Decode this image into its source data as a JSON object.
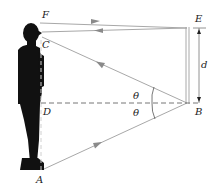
{
  "figure": {
    "labels": {
      "F": "F",
      "C": "C",
      "D": "D",
      "A": "A",
      "E": "E",
      "B": "B",
      "d": "d",
      "theta_upper": "θ",
      "theta_lower": "θ"
    },
    "colors": {
      "ray": "#a8a8a8",
      "arrow": "#8a8a8a",
      "person": "#111111",
      "mirror": "#b8b8b8",
      "dashed": "#777777",
      "text": "#222222"
    }
  }
}
